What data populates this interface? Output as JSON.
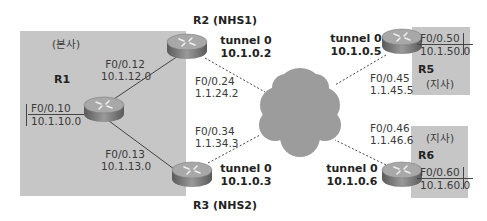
{
  "diagram": {
    "type": "DMVPN network topology",
    "colors": {
      "region": "#c6c6c6",
      "cloud": "#9a9a9a",
      "router_body": "#8a8a8a",
      "link": "#444444"
    },
    "regions": [
      {
        "id": "hq",
        "label": "(본사)"
      },
      {
        "id": "branch-r5",
        "label": "(지사)"
      },
      {
        "id": "branch-r6",
        "label": "(지사)"
      }
    ],
    "routers": {
      "r1": {
        "name": "R1",
        "lan_if": "F0/0.10",
        "lan_net": "10.1.10.0",
        "link_r2_if": "F0/0.12",
        "link_r2_net": "10.1.12.0",
        "link_r3_if": "F0/0.13",
        "link_r3_net": "10.1.13.0"
      },
      "r2": {
        "name": "R2 (NHS1)",
        "tunnel_label": "tunnel 0",
        "tunnel_ip": "10.1.0.2",
        "wan_if": "F0/0.24",
        "wan_ip": "1.1.24.2"
      },
      "r3": {
        "name": "R3 (NHS2)",
        "tunnel_label": "tunnel 0",
        "tunnel_ip": "10.1.0.3",
        "wan_if": "F0/0.34",
        "wan_ip": "1.1.34.3"
      },
      "r5": {
        "name": "R5",
        "tunnel_label": "tunnel 0",
        "tunnel_ip": "10.1.0.5",
        "wan_if": "F0/0.45",
        "wan_ip": "1.1.45.5",
        "lan_if": "F0/0.50",
        "lan_net": "10.1.50.0"
      },
      "r6": {
        "name": "R6",
        "tunnel_label": "tunnel 0",
        "tunnel_ip": "10.1.0.6",
        "wan_if": "F0/0.46",
        "wan_ip": "1.1.46.6",
        "lan_if": "F0/0.60",
        "lan_net": "10.1.60.0"
      }
    },
    "links": [
      {
        "from": "R1",
        "to": "R2",
        "style": "solid"
      },
      {
        "from": "R1",
        "to": "R3",
        "style": "solid"
      },
      {
        "from": "R2",
        "to": "cloud",
        "style": "dashed"
      },
      {
        "from": "R3",
        "to": "cloud",
        "style": "dashed"
      },
      {
        "from": "R5",
        "to": "cloud",
        "style": "dashed"
      },
      {
        "from": "R6",
        "to": "cloud",
        "style": "dashed"
      }
    ]
  }
}
